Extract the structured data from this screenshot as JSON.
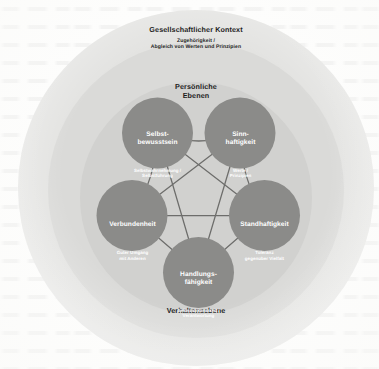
{
  "figure": {
    "rings": [
      {
        "id": "gesellschaftlicher-kontext",
        "title": "Gesellschaftlicher Kontext",
        "subtitle": "Zugehörigkeit /\nAbgleich von Werten und Prinzipien",
        "fill": "#e2e2e0"
      },
      {
        "id": "persoenliche-ebenen",
        "title": "Persönliche\nEbenen",
        "subtitle": "",
        "fill": "#d8d8d6"
      },
      {
        "id": "verhaltensebene",
        "title": "Verhaltensebene",
        "subtitle": "",
        "fill": "#cfcfcd"
      }
    ],
    "nodes": [
      {
        "id": "selbstbewusstsein",
        "title": "Selbst-\nbewusstsein",
        "subtitle": "Selbstwahrnehmung /\nSelbstführung",
        "cx": 157.5,
        "cy": 133.0,
        "r": 35.5
      },
      {
        "id": "sinnhaftigkeit",
        "title": "Sinn-\nhaftigkeit",
        "subtitle": "Werte /\nPrinzipien",
        "cx": 240.0,
        "cy": 133.0,
        "r": 35.5
      },
      {
        "id": "standhaftigkeit",
        "title": "Standhaftigkeit",
        "subtitle": "Toleranz\ngegenüber Vielfalt",
        "cx": 264.5,
        "cy": 215.5,
        "r": 35.5
      },
      {
        "id": "handlungsfaehigkeit",
        "title": "Handlungs-\nfähigkeit",
        "subtitle": "Selbstwirksamkeit /\nVerantwortung",
        "cx": 198.5,
        "cy": 272.5,
        "r": 35.5
      },
      {
        "id": "verbundenheit",
        "title": "Verbundenheit",
        "subtitle": "Guter Umgang\nmit Anderen",
        "cx": 132.0,
        "cy": 215.5,
        "r": 35.5
      }
    ],
    "colors": {
      "node_fill": "#8b8b89",
      "connector": "#6d6d6b",
      "label_text": "#1d1d1d",
      "node_text": "#ffffff",
      "page_background": "#fdfdfc"
    }
  }
}
